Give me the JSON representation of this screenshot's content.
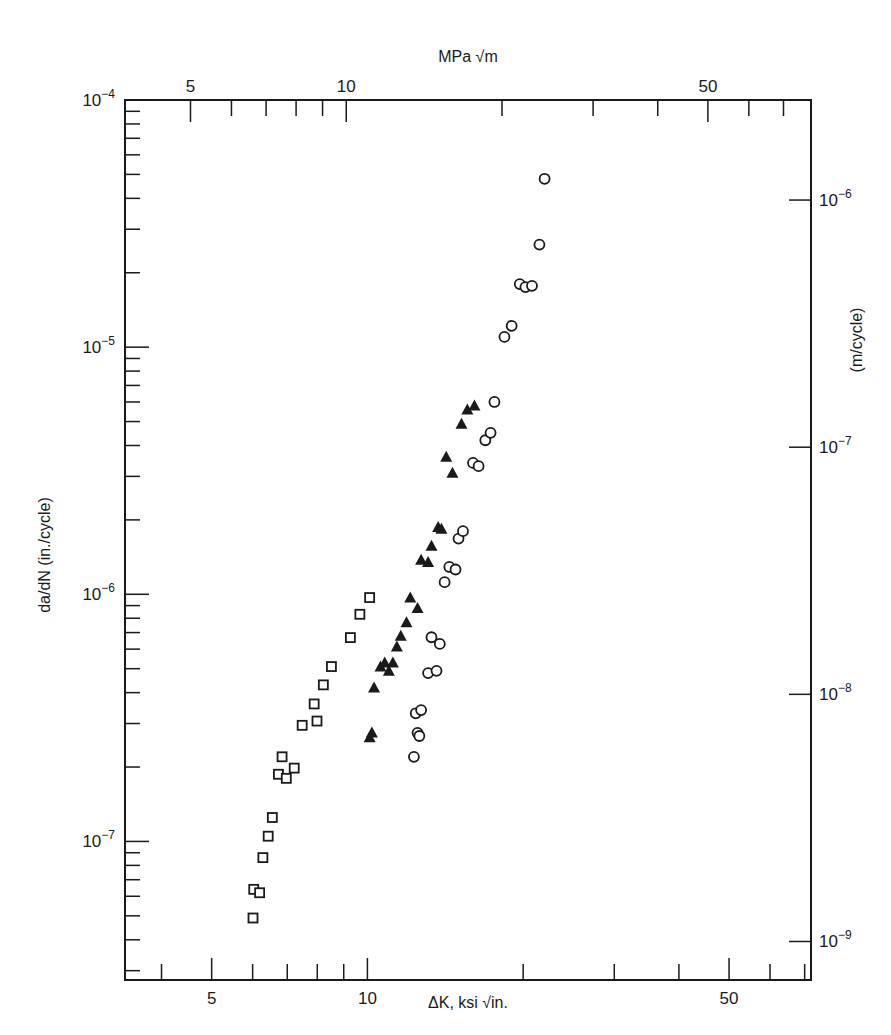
{
  "chart_data": {
    "type": "scatter",
    "title": "",
    "xlabel": "ΔK, ksi √in.",
    "xlabel_top": "MPa √m",
    "ylabel": "da/dN (in./cycle)",
    "ylabel_right": "(m/cycle)",
    "xscale": "log",
    "yscale": "log",
    "xlim": [
      3.4,
      72
    ],
    "ylim": [
      2.75e-08,
      0.0001
    ],
    "x_ticks_bottom": [
      {
        "value": 5,
        "label": "5"
      },
      {
        "value": 10,
        "label": "10"
      },
      {
        "value": 50,
        "label": "50"
      }
    ],
    "x_ticks_top": [
      {
        "value": 5,
        "label": "5"
      },
      {
        "value": 10,
        "label": "10"
      },
      {
        "value": 50,
        "label": "50"
      }
    ],
    "y_ticks_left": [
      {
        "value": 0.0001,
        "base": "10",
        "exp": "−4"
      },
      {
        "value": 1e-05,
        "base": "10",
        "exp": "−5"
      },
      {
        "value": 1e-06,
        "base": "10",
        "exp": "−6"
      },
      {
        "value": 1e-07,
        "base": "10",
        "exp": "−7"
      }
    ],
    "y_ticks_right": [
      {
        "value": 1e-06,
        "base": "10",
        "exp": "−6"
      },
      {
        "value": 1e-07,
        "base": "10",
        "exp": "−7"
      },
      {
        "value": 1e-08,
        "base": "10",
        "exp": "−8"
      },
      {
        "value": 1e-09,
        "base": "10",
        "exp": "−9"
      }
    ],
    "grid": false,
    "legend": null,
    "series": [
      {
        "name": "squares",
        "marker": "open-square",
        "points": [
          [
            6.01,
            4.9e-08
          ],
          [
            6.03,
            6.4e-08
          ],
          [
            6.19,
            6.2e-08
          ],
          [
            6.28,
            8.6e-08
          ],
          [
            6.43,
            1.05e-07
          ],
          [
            6.55,
            1.25e-07
          ],
          [
            6.73,
            1.87e-07
          ],
          [
            6.97,
            1.8e-07
          ],
          [
            6.84,
            2.2e-07
          ],
          [
            7.22,
            1.98e-07
          ],
          [
            7.48,
            2.95e-07
          ],
          [
            7.99,
            3.07e-07
          ],
          [
            7.89,
            3.6e-07
          ],
          [
            8.22,
            4.3e-07
          ],
          [
            8.52,
            5.1e-07
          ],
          [
            9.27,
            6.68e-07
          ],
          [
            9.67,
            8.3e-07
          ],
          [
            10.1,
            9.7e-07
          ]
        ]
      },
      {
        "name": "triangles",
        "marker": "filled-triangle",
        "points": [
          [
            10.1,
            2.64e-07
          ],
          [
            10.2,
            2.76e-07
          ],
          [
            10.3,
            4.2e-07
          ],
          [
            10.6,
            5.1e-07
          ],
          [
            10.8,
            5.3e-07
          ],
          [
            11.0,
            4.9e-07
          ],
          [
            11.2,
            5.3e-07
          ],
          [
            11.4,
            6.15e-07
          ],
          [
            11.6,
            6.8e-07
          ],
          [
            11.9,
            7.7e-07
          ],
          [
            12.1,
            9.7e-07
          ],
          [
            12.5,
            8.8e-07
          ],
          [
            12.7,
            1.38e-06
          ],
          [
            13.1,
            1.35e-06
          ],
          [
            13.3,
            1.57e-06
          ],
          [
            13.7,
            1.87e-06
          ],
          [
            13.9,
            1.84e-06
          ],
          [
            14.2,
            3.6e-06
          ],
          [
            14.6,
            3.1e-06
          ],
          [
            15.2,
            4.9e-06
          ],
          [
            15.6,
            5.6e-06
          ],
          [
            16.1,
            5.8e-06
          ]
        ]
      },
      {
        "name": "circles",
        "marker": "open-circle",
        "points": [
          [
            12.3,
            2.2e-07
          ],
          [
            12.5,
            2.75e-07
          ],
          [
            12.6,
            2.67e-07
          ],
          [
            12.4,
            3.3e-07
          ],
          [
            12.7,
            3.4e-07
          ],
          [
            13.1,
            4.8e-07
          ],
          [
            13.6,
            4.9e-07
          ],
          [
            13.3,
            6.7e-07
          ],
          [
            13.8,
            6.3e-07
          ],
          [
            14.1,
            1.12e-06
          ],
          [
            14.4,
            1.29e-06
          ],
          [
            14.8,
            1.26e-06
          ],
          [
            15.0,
            1.68e-06
          ],
          [
            15.3,
            1.8e-06
          ],
          [
            16.0,
            3.4e-06
          ],
          [
            16.4,
            3.3e-06
          ],
          [
            16.9,
            4.2e-06
          ],
          [
            17.3,
            4.5e-06
          ],
          [
            17.6,
            6e-06
          ],
          [
            18.4,
            1.1e-05
          ],
          [
            19.0,
            1.22e-05
          ],
          [
            19.7,
            1.8e-05
          ],
          [
            20.2,
            1.75e-05
          ],
          [
            20.8,
            1.77e-05
          ],
          [
            21.5,
            2.6e-05
          ],
          [
            22.0,
            4.8e-05
          ]
        ]
      }
    ]
  }
}
